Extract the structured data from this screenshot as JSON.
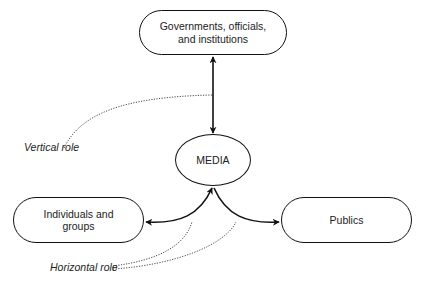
{
  "diagram": {
    "nodes": {
      "governments": {
        "line1": "Governments, officials,",
        "line2": "and institutions"
      },
      "media": {
        "label": "MEDIA"
      },
      "individuals": {
        "line1": "Individuals and",
        "line2": "groups"
      },
      "publics": {
        "label": "Publics"
      }
    },
    "annotations": {
      "vertical_role": "Vertical role",
      "horizontal_role": "Horizontal role"
    },
    "edges": [
      {
        "from": "governments",
        "to": "media",
        "style": "solid",
        "direction": "both"
      },
      {
        "from": "media",
        "to": "individuals",
        "style": "solid",
        "direction": "both"
      },
      {
        "from": "media",
        "to": "publics",
        "style": "solid",
        "direction": "both"
      }
    ],
    "colors": {
      "stroke": "#111111",
      "text": "#222222",
      "background": "#ffffff"
    }
  }
}
